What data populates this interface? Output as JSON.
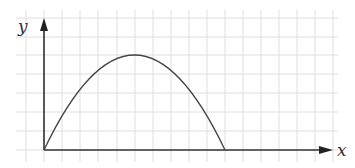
{
  "diagram": {
    "type": "parabola-graph",
    "x_axis_label": "x",
    "y_axis_label": "y",
    "grid": true,
    "curve": {
      "shape": "downward parabola",
      "start": [
        0,
        0
      ],
      "vertex": [
        5,
        5
      ],
      "end": [
        10,
        0
      ],
      "grid_units": true
    },
    "colors": {
      "grid": "#dedede",
      "axis": "#333333",
      "curve": "#444444"
    }
  }
}
